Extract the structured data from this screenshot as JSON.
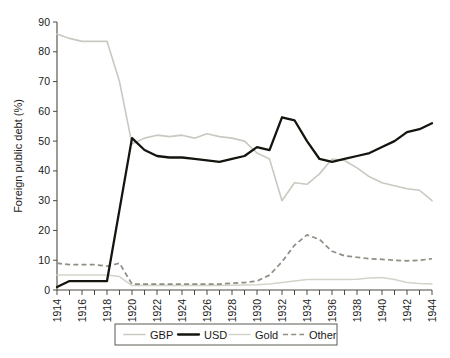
{
  "chart_data": {
    "type": "line",
    "title": "",
    "xlabel": "",
    "ylabel": "Foreign public debt (%)",
    "xlim": [
      1914,
      1944
    ],
    "ylim": [
      0,
      90
    ],
    "grid": false,
    "legend_position": "bottom",
    "x": [
      1914,
      1915,
      1916,
      1917,
      1918,
      1919,
      1920,
      1921,
      1922,
      1923,
      1924,
      1925,
      1926,
      1927,
      1928,
      1929,
      1930,
      1931,
      1932,
      1933,
      1934,
      1935,
      1936,
      1937,
      1938,
      1939,
      1940,
      1941,
      1942,
      1943,
      1944
    ],
    "xticks": [
      "1914",
      "1915",
      "1916",
      "1917",
      "1918",
      "1919",
      "1920",
      "1921",
      "1922",
      "1923",
      "1924",
      "1925",
      "1926",
      "1927",
      "1928",
      "1929",
      "1930",
      "1931",
      "1932",
      "1933",
      "1934",
      "1935",
      "1936",
      "1937",
      "1938",
      "1939",
      "1940",
      "1941",
      "1942",
      "1943",
      "1944"
    ],
    "xtick_labels_shown": [
      "1914",
      "1916",
      "1918",
      "1920",
      "1922",
      "1924",
      "1926",
      "1928",
      "1930",
      "1932",
      "1934",
      "1936",
      "1938",
      "1940",
      "1942",
      "1944"
    ],
    "yticks": [
      0,
      10,
      20,
      30,
      40,
      50,
      60,
      70,
      80,
      90
    ],
    "series": [
      {
        "name": "GBP",
        "color": "#c9c9c1",
        "style": "solid",
        "values": [
          86,
          84.5,
          83.5,
          83.5,
          83.5,
          70,
          49,
          51,
          52,
          51.5,
          52,
          51,
          52.5,
          51.5,
          51,
          50,
          46,
          44,
          30,
          36,
          35.5,
          39,
          44,
          43.5,
          41,
          38,
          36,
          35,
          34,
          33.5,
          30
        ]
      },
      {
        "name": "USD",
        "color": "#15150f",
        "style": "solid",
        "values": [
          1,
          3,
          3,
          3,
          3,
          27,
          51,
          47,
          45,
          44.5,
          44.5,
          44,
          43.5,
          43,
          44,
          45,
          48,
          47,
          58,
          57,
          50,
          44,
          43,
          44,
          45,
          46,
          48,
          50,
          53,
          54,
          56
        ]
      },
      {
        "name": "Gold",
        "color": "#d3d3ca",
        "style": "solid",
        "values": [
          5,
          5,
          5,
          5,
          5,
          4.5,
          1.5,
          1.5,
          1.5,
          1.5,
          1.5,
          1.5,
          1.5,
          1.5,
          1.6,
          1.7,
          1.8,
          2,
          2.5,
          3,
          3.5,
          3.5,
          3.5,
          3.5,
          3.6,
          4,
          4.2,
          3.5,
          2.5,
          2.2,
          2
        ]
      },
      {
        "name": "Other",
        "color": "#8e8e85",
        "style": "dashed",
        "values": [
          9,
          8.5,
          8.5,
          8.5,
          8,
          9,
          2,
          2,
          2,
          2,
          2,
          2,
          2,
          2,
          2.3,
          2.5,
          3,
          5,
          9.5,
          15,
          18.5,
          17,
          13,
          11.5,
          11,
          10.5,
          10.3,
          10,
          9.8,
          10,
          10.5
        ]
      }
    ],
    "legend": [
      {
        "label": "GBP",
        "color": "#c9c9c1",
        "style": "solid"
      },
      {
        "label": "USD",
        "color": "#15150f",
        "style": "solid"
      },
      {
        "label": "Gold",
        "color": "#d3d3ca",
        "style": "solid"
      },
      {
        "label": "Other",
        "color": "#8e8e85",
        "style": "dashed"
      }
    ]
  }
}
